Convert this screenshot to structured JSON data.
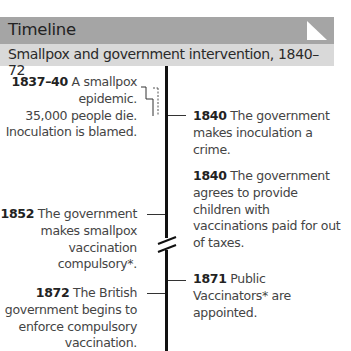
{
  "header": {
    "title": "Timeline",
    "subtitle": "Smallpox and government intervention, 1840–72",
    "corner_icon": "page-fold-icon",
    "colors": {
      "header_bg": "#a5a5a5",
      "subtitle_bg": "#d9d9d9",
      "axis": "#111111"
    }
  },
  "timeline": {
    "axis_break": "double-slash-break-icon",
    "events_left": [
      {
        "year": "1837–40",
        "lines": [
          " A smallpox",
          "epidemic.",
          "35,000 people die.",
          "Inoculation is blamed."
        ]
      },
      {
        "year": "1852",
        "lines": [
          " The government",
          "makes smallpox",
          "vaccination",
          "compulsory*."
        ]
      },
      {
        "year": "1872",
        "lines": [
          " The British",
          "government begins to",
          "enforce compulsory",
          "vaccination."
        ]
      }
    ],
    "events_right": [
      {
        "year": "1840",
        "lines": [
          " The government",
          "makes inoculation a",
          "crime."
        ]
      },
      {
        "year": "1840",
        "lines": [
          " The government",
          "agrees to provide",
          "children with",
          "vaccinations paid for out",
          "of taxes."
        ]
      },
      {
        "year": "1871",
        "lines": [
          " Public",
          "Vaccinators* are",
          "appointed."
        ]
      }
    ]
  }
}
